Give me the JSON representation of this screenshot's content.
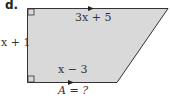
{
  "part_label": "d.",
  "labels": {
    "top": "3x + 5",
    "left": "x + 1",
    "bottom": "x − 3",
    "area": "A = ?"
  },
  "colors": {
    "fill": "#d9d9d9",
    "stroke": "#333333"
  }
}
